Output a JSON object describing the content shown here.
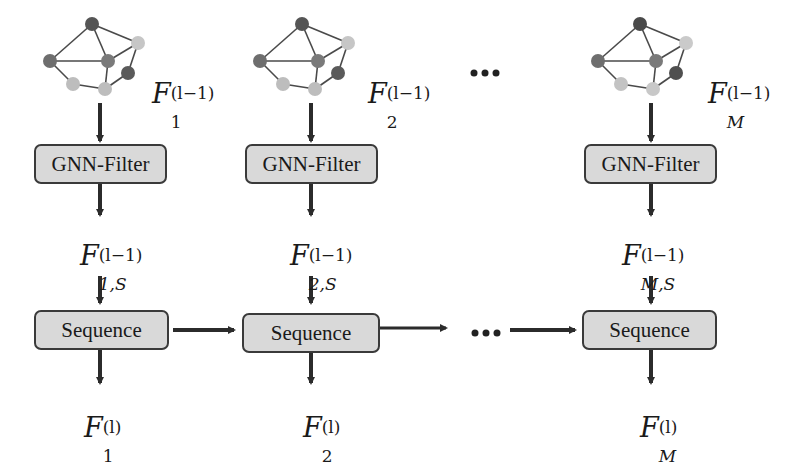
{
  "diagram": {
    "columns": [
      {
        "id": "col-1",
        "center_x": 103,
        "graph_label": {
          "base": "F",
          "sub": "1",
          "sup": "(l−1)"
        },
        "filter_label": "GNN-Filter",
        "filtered_label": {
          "base": "F",
          "sub": "1,S",
          "sup": "(l−1)"
        },
        "sequence_label": "Sequence",
        "output_label": {
          "base": "F",
          "sub": "1",
          "sup": "(l)"
        }
      },
      {
        "id": "col-2",
        "center_x": 313,
        "graph_label": {
          "base": "F",
          "sub": "2",
          "sup": "(l−1)"
        },
        "filter_label": "GNN-Filter",
        "filtered_label": {
          "base": "F",
          "sub": "2,S",
          "sup": "(l−1)"
        },
        "sequence_label": "Sequence",
        "output_label": {
          "base": "F",
          "sub": "2",
          "sup": "(l)"
        }
      },
      {
        "id": "col-M",
        "center_x": 652,
        "graph_label": {
          "base": "F",
          "sub": "M",
          "sup": "(l−1)"
        },
        "filter_label": "GNN-Filter",
        "filtered_label": {
          "base": "F",
          "sub": "M,S",
          "sup": "(l−1)"
        },
        "sequence_label": "Sequence",
        "output_label": {
          "base": "F",
          "sub": "M",
          "sup": "(l)"
        }
      }
    ],
    "ellipsis_top": "•••",
    "ellipsis_middle": "•••",
    "colors": {
      "box_fill": "#d9d9d9",
      "box_border": "#3a3a3a",
      "arrow": "#2b2b2b",
      "edge": "#4a4a4a",
      "node_dark": "#5a5a5a",
      "node_mid": "#7d7d7d",
      "node_light": "#c4c4c4"
    }
  }
}
